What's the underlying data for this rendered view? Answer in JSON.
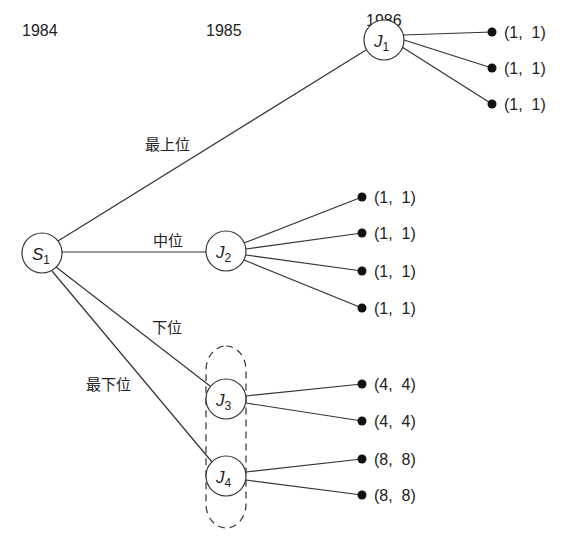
{
  "years": [
    {
      "label": "1984",
      "x": 22,
      "y": 36
    },
    {
      "label": "1985",
      "x": 206,
      "y": 36
    },
    {
      "label": "1986",
      "x": 366,
      "y": 36
    }
  ],
  "nodes": {
    "S1": {
      "main": "S",
      "sub": "1",
      "x": 42,
      "y": 253
    },
    "J1": {
      "main": "J",
      "sub": "1",
      "x": 384,
      "y": 40
    },
    "J2": {
      "main": "J",
      "sub": "2",
      "x": 226,
      "y": 251
    },
    "J3": {
      "main": "J",
      "sub": "3",
      "x": 226,
      "y": 399
    },
    "J4": {
      "main": "J",
      "sub": "4",
      "x": 226,
      "y": 476
    }
  },
  "edge_labels": {
    "top": "最上位",
    "middle": "中位",
    "lower": "下位",
    "bottom": "最下位"
  },
  "payoffs": {
    "J1": [
      "(1,  1)",
      "(1,  1)",
      "(1,  1)"
    ],
    "J2": [
      "(1,  1)",
      "(1,  1)",
      "(1,  1)",
      "(1,  1)"
    ],
    "J3": [
      "(4,  4)",
      "(4,  4)"
    ],
    "J4": [
      "(8,  8)",
      "(8,  8)"
    ]
  },
  "colors": {
    "line": "#333333",
    "text": "#222222",
    "background": "#ffffff"
  }
}
